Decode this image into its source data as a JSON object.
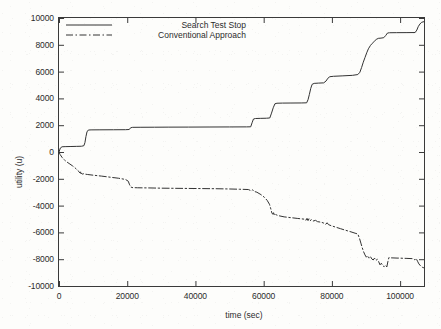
{
  "chart_data": {
    "type": "line",
    "title": "",
    "xlabel": "time (sec)",
    "ylabel": "utility (u)",
    "xlim": [
      0,
      107000
    ],
    "ylim": [
      -10000,
      10000
    ],
    "xticks": [
      0,
      20000,
      40000,
      60000,
      80000,
      100000
    ],
    "xticklabels": [
      "0",
      "20000",
      "40000",
      "60000",
      "80000",
      "100000"
    ],
    "yticks": [
      -10000,
      -8000,
      -6000,
      -4000,
      -2000,
      0,
      2000,
      4000,
      6000,
      8000,
      10000
    ],
    "yticklabels": [
      "-10000",
      "-8000",
      "-6000",
      "-4000",
      "-2000",
      "0",
      "2000",
      "4000",
      "6000",
      "8000",
      "10000"
    ],
    "grid": false,
    "legend_position": "top-center",
    "series": [
      {
        "name": "Search Test Stop",
        "style": "solid",
        "color": "#333333",
        "points": [
          [
            0,
            0
          ],
          [
            400,
            300
          ],
          [
            900,
            390
          ],
          [
            1800,
            400
          ],
          [
            3500,
            410
          ],
          [
            5200,
            420
          ],
          [
            6600,
            430
          ],
          [
            7300,
            470
          ],
          [
            7600,
            700
          ],
          [
            7900,
            1150
          ],
          [
            8200,
            1500
          ],
          [
            8600,
            1640
          ],
          [
            9400,
            1650
          ],
          [
            12000,
            1655
          ],
          [
            16000,
            1660
          ],
          [
            19500,
            1665
          ],
          [
            20600,
            1680
          ],
          [
            21000,
            1810
          ],
          [
            21600,
            1840
          ],
          [
            24000,
            1845
          ],
          [
            28000,
            1850
          ],
          [
            32000,
            1855
          ],
          [
            38000,
            1860
          ],
          [
            44000,
            1865
          ],
          [
            50000,
            1870
          ],
          [
            55000,
            1875
          ],
          [
            56200,
            1880
          ],
          [
            56600,
            2180
          ],
          [
            57000,
            2460
          ],
          [
            57600,
            2500
          ],
          [
            59000,
            2510
          ],
          [
            60800,
            2520
          ],
          [
            61800,
            2540
          ],
          [
            62300,
            2900
          ],
          [
            62800,
            3300
          ],
          [
            63300,
            3600
          ],
          [
            63900,
            3640
          ],
          [
            65500,
            3650
          ],
          [
            68000,
            3655
          ],
          [
            71000,
            3660
          ],
          [
            72600,
            3670
          ],
          [
            73000,
            3900
          ],
          [
            73400,
            4300
          ],
          [
            73800,
            4750
          ],
          [
            74200,
            5050
          ],
          [
            74800,
            5120
          ],
          [
            76000,
            5140
          ],
          [
            77600,
            5160
          ],
          [
            78300,
            5300
          ],
          [
            78800,
            5500
          ],
          [
            79400,
            5620
          ],
          [
            80500,
            5650
          ],
          [
            83000,
            5680
          ],
          [
            86000,
            5720
          ],
          [
            87600,
            5780
          ],
          [
            88200,
            5950
          ],
          [
            88700,
            6300
          ],
          [
            89200,
            6700
          ],
          [
            89700,
            7050
          ],
          [
            90200,
            7400
          ],
          [
            90700,
            7700
          ],
          [
            91300,
            7950
          ],
          [
            91800,
            8100
          ],
          [
            92400,
            8250
          ],
          [
            93000,
            8400
          ],
          [
            93600,
            8480
          ],
          [
            94400,
            8500
          ],
          [
            95200,
            8530
          ],
          [
            95800,
            8700
          ],
          [
            96300,
            8880
          ],
          [
            96900,
            8900
          ],
          [
            99000,
            8905
          ],
          [
            102000,
            8910
          ],
          [
            104400,
            8915
          ],
          [
            104900,
            9100
          ],
          [
            105300,
            9350
          ],
          [
            105800,
            9550
          ],
          [
            106300,
            9680
          ],
          [
            106900,
            9720
          ]
        ]
      },
      {
        "name": "Conventional Approach",
        "style": "dashdot",
        "color": "#333333",
        "points": [
          [
            0,
            0
          ],
          [
            300,
            -180
          ],
          [
            900,
            -400
          ],
          [
            1600,
            -600
          ],
          [
            2400,
            -760
          ],
          [
            3200,
            -900
          ],
          [
            4000,
            -1040
          ],
          [
            4700,
            -1180
          ],
          [
            5300,
            -1330
          ],
          [
            5800,
            -1450
          ],
          [
            6100,
            -1560
          ],
          [
            6300,
            -1480
          ],
          [
            6500,
            -1640
          ],
          [
            6700,
            -1530
          ],
          [
            6900,
            -1660
          ],
          [
            7200,
            -1620
          ],
          [
            7600,
            -1650
          ],
          [
            8400,
            -1680
          ],
          [
            10000,
            -1730
          ],
          [
            12500,
            -1800
          ],
          [
            15000,
            -1880
          ],
          [
            17500,
            -1960
          ],
          [
            19500,
            -2050
          ],
          [
            20300,
            -2180
          ],
          [
            20700,
            -2450
          ],
          [
            21100,
            -2620
          ],
          [
            21600,
            -2660
          ],
          [
            23000,
            -2670
          ],
          [
            26000,
            -2680
          ],
          [
            30000,
            -2700
          ],
          [
            34000,
            -2710
          ],
          [
            38000,
            -2720
          ],
          [
            42000,
            -2730
          ],
          [
            46000,
            -2740
          ],
          [
            50000,
            -2760
          ],
          [
            53000,
            -2780
          ],
          [
            55500,
            -2800
          ],
          [
            56400,
            -2900
          ],
          [
            56800,
            -2820
          ],
          [
            57300,
            -2950
          ],
          [
            58000,
            -3000
          ],
          [
            59200,
            -3180
          ],
          [
            60200,
            -3380
          ],
          [
            61000,
            -3600
          ],
          [
            61700,
            -3900
          ],
          [
            62100,
            -4250
          ],
          [
            62400,
            -4550
          ],
          [
            62700,
            -4650
          ],
          [
            62900,
            -4530
          ],
          [
            63100,
            -4680
          ],
          [
            63400,
            -4600
          ],
          [
            63700,
            -4700
          ],
          [
            64500,
            -4760
          ],
          [
            66000,
            -4840
          ],
          [
            68000,
            -4900
          ],
          [
            70000,
            -4960
          ],
          [
            71800,
            -5010
          ],
          [
            72400,
            -5100
          ],
          [
            72700,
            -4950
          ],
          [
            73000,
            -5120
          ],
          [
            73300,
            -4980
          ],
          [
            73600,
            -5130
          ],
          [
            74000,
            -5050
          ],
          [
            74400,
            -5160
          ],
          [
            75200,
            -5100
          ],
          [
            75800,
            -5200
          ],
          [
            76600,
            -5230
          ],
          [
            77400,
            -5280
          ],
          [
            78200,
            -5400
          ],
          [
            78600,
            -5280
          ],
          [
            79000,
            -5420
          ],
          [
            79800,
            -5500
          ],
          [
            81000,
            -5600
          ],
          [
            82500,
            -5720
          ],
          [
            84000,
            -5840
          ],
          [
            85600,
            -5960
          ],
          [
            86800,
            -6060
          ],
          [
            87600,
            -6120
          ],
          [
            88100,
            -6450
          ],
          [
            88500,
            -6800
          ],
          [
            88900,
            -7150
          ],
          [
            89300,
            -7450
          ],
          [
            89700,
            -7680
          ],
          [
            90100,
            -7850
          ],
          [
            90500,
            -7740
          ],
          [
            90900,
            -7920
          ],
          [
            91300,
            -7800
          ],
          [
            91700,
            -7980
          ],
          [
            92100,
            -8060
          ],
          [
            92500,
            -7920
          ],
          [
            92900,
            -8100
          ],
          [
            93300,
            -8000
          ],
          [
            93700,
            -8180
          ],
          [
            94100,
            -8420
          ],
          [
            94500,
            -8300
          ],
          [
            94900,
            -8480
          ],
          [
            95300,
            -8560
          ],
          [
            95700,
            -8440
          ],
          [
            96100,
            -8580
          ],
          [
            96400,
            -8200
          ],
          [
            96700,
            -7880
          ],
          [
            97400,
            -7900
          ],
          [
            99500,
            -7920
          ],
          [
            102000,
            -7940
          ],
          [
            103800,
            -7960
          ],
          [
            104300,
            -8050
          ],
          [
            104700,
            -7940
          ],
          [
            105100,
            -8150
          ],
          [
            105500,
            -8350
          ],
          [
            106000,
            -8500
          ],
          [
            106500,
            -8600
          ],
          [
            106900,
            -8640
          ]
        ]
      }
    ]
  },
  "legend": {
    "entries": [
      {
        "label": "Search Test Stop",
        "style": "solid"
      },
      {
        "label": "Conventional Approach",
        "style": "dashdot"
      }
    ]
  },
  "axes": {
    "x_title": "time (sec)",
    "y_title": "utility (u)"
  }
}
